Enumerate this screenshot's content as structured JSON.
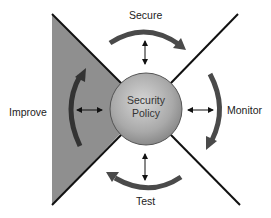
{
  "diagram": {
    "center": {
      "line1": "Security",
      "line2": "Policy"
    },
    "phases": [
      {
        "label": "Secure",
        "position": "top"
      },
      {
        "label": "Monitor",
        "position": "right"
      },
      {
        "label": "Test",
        "position": "bottom"
      },
      {
        "label": "Improve",
        "position": "left"
      }
    ],
    "colors": {
      "shaded_region": "#8f8f8f",
      "arrows": "#4a4a4a",
      "circle_light": "#d0d0d0",
      "circle_dark": "#8a8a8a",
      "lines": "#111111"
    }
  }
}
